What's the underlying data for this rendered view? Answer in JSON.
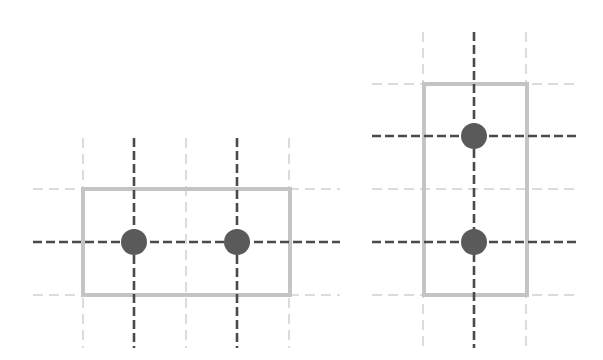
{
  "colors": {
    "background": "#ffffff",
    "light_line": "#b8b8b8",
    "dark_line": "#4a4a4a",
    "rect": "#c4c4c4",
    "dot": "#5a5a5a"
  },
  "figures": [
    {
      "name": "horizontal-layout",
      "v_lines": [
        {
          "x": 83,
          "y1": 138,
          "y2": 348,
          "style": "light"
        },
        {
          "x": 134,
          "y1": 138,
          "y2": 348,
          "style": "dark"
        },
        {
          "x": 186,
          "y1": 138,
          "y2": 348,
          "style": "light"
        },
        {
          "x": 237,
          "y1": 138,
          "y2": 348,
          "style": "dark"
        },
        {
          "x": 289,
          "y1": 138,
          "y2": 348,
          "style": "light"
        }
      ],
      "h_lines": [
        {
          "y": 189,
          "x1": 33,
          "x2": 340,
          "style": "light"
        },
        {
          "y": 242,
          "x1": 33,
          "x2": 340,
          "style": "dark"
        },
        {
          "y": 295,
          "x1": 33,
          "x2": 340,
          "style": "light"
        }
      ],
      "rect": {
        "x": 83,
        "y": 189,
        "w": 207,
        "h": 106
      },
      "dots": [
        {
          "cx": 134,
          "cy": 242,
          "r": 13
        },
        {
          "cx": 237,
          "cy": 242,
          "r": 13
        }
      ]
    },
    {
      "name": "vertical-layout",
      "v_lines": [
        {
          "x": 423,
          "y1": 32,
          "y2": 348,
          "style": "light"
        },
        {
          "x": 474,
          "y1": 32,
          "y2": 348,
          "style": "dark"
        },
        {
          "x": 526,
          "y1": 32,
          "y2": 348,
          "style": "light"
        }
      ],
      "h_lines": [
        {
          "y": 84,
          "x1": 372,
          "x2": 576,
          "style": "light"
        },
        {
          "y": 136,
          "x1": 372,
          "x2": 576,
          "style": "dark"
        },
        {
          "y": 189,
          "x1": 372,
          "x2": 576,
          "style": "light"
        },
        {
          "y": 242,
          "x1": 372,
          "x2": 576,
          "style": "dark"
        },
        {
          "y": 295,
          "x1": 372,
          "x2": 576,
          "style": "light"
        }
      ],
      "rect": {
        "x": 424,
        "y": 84,
        "w": 103,
        "h": 211
      },
      "dots": [
        {
          "cx": 474,
          "cy": 136,
          "r": 13
        },
        {
          "cx": 474,
          "cy": 242,
          "r": 13
        }
      ]
    }
  ]
}
